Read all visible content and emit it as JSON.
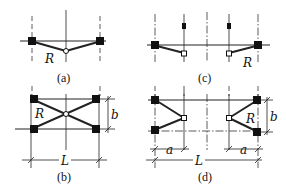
{
  "figure": {
    "panels": [
      {
        "id": "a",
        "caption": "(a)",
        "labels": {
          "radius": "R"
        }
      },
      {
        "id": "b",
        "caption": "(b)",
        "labels": {
          "radius": "R",
          "height": "b",
          "length": "L"
        }
      },
      {
        "id": "c",
        "caption": "(c)",
        "labels": {
          "radius": "R"
        }
      },
      {
        "id": "d",
        "caption": "(d)",
        "labels": {
          "radius": "R",
          "height": "b",
          "length": "L",
          "offset_left": "a",
          "offset_right": "a"
        }
      }
    ]
  }
}
